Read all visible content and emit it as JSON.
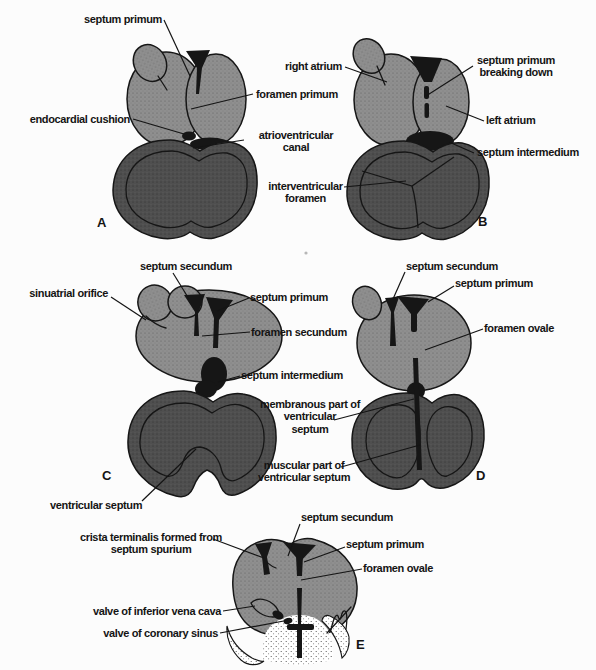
{
  "figure": {
    "colors": {
      "atrium": "#8f8f8f",
      "ventricle": "#4f4f4f",
      "dark": "#161616",
      "background": "#fcfcfc",
      "text": "#141414"
    },
    "panels": [
      {
        "letter": "A",
        "labels": {
          "septum_primum": "septum primum",
          "foramen_primum": "foramen primum",
          "endocardial_cushion": "endocardial cushion",
          "atrioventricular_canal": "atrioventricular\ncanal"
        }
      },
      {
        "letter": "B",
        "labels": {
          "right_atrium": "right atrium",
          "septum_primum_breaking_down": "septum primum\nbreaking down",
          "left_atrium": "left atrium",
          "septum_intermedium": "septum intermedium",
          "interventricular_foramen": "interventricular\nforamen"
        }
      },
      {
        "letter": "C",
        "labels": {
          "septum_secundum": "septum secundum",
          "sinuatrial_orifice": "sinuatrial orifice",
          "septum_primum": "septum primum",
          "foramen_secundum": "foramen secundum",
          "septum_intermedium": "septum intermedium",
          "ventricular_septum": "ventricular septum"
        }
      },
      {
        "letter": "D",
        "labels": {
          "septum_secundum": "septum secundum",
          "septum_primum": "septum primum",
          "foramen_ovale": "foramen ovale",
          "membranous_part_of_ventricular_septum": "membranous part of\nventricular\nseptum",
          "muscular_part_of_ventricular_septum": "muscular part of\nventricular septum"
        }
      },
      {
        "letter": "E",
        "labels": {
          "septum_secundum": "septum secundum",
          "crista_terminalis": "crista terminalis formed from\nseptum spurium",
          "septum_primum": "septum primum",
          "foramen_ovale": "foramen ovale",
          "valve_of_inferior_vena_cava": "valve of inferior vena cava",
          "valve_of_coronary_sinus": "valve of coronary sinus"
        }
      }
    ]
  }
}
